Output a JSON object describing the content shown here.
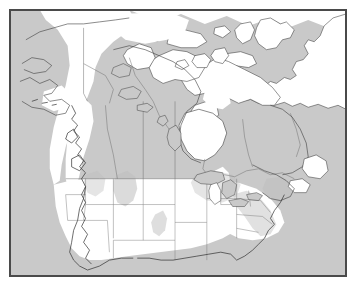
{
  "figure": {
    "kind": "distribution-range-map",
    "region": "North America",
    "frame": {
      "border_color": "#4a4a4a",
      "x": 9,
      "y": 9,
      "width": 338,
      "height": 268
    },
    "colors": {
      "background": "#ffffff",
      "ocean": "#c9c9c9",
      "land_absent": "#ffffff",
      "range_shade": "#bdbdbd",
      "coastline": "#3c3c3c",
      "political_boundary": "#6f6f6f",
      "state_boundary": "#767676"
    },
    "legend_present": false,
    "title": "",
    "caption": "",
    "axis_labels": [],
    "tick_labels": [],
    "annotations": []
  },
  "map": {
    "projection_hint": "conic",
    "countries": [
      {
        "name": "Canada",
        "shaded": true
      },
      {
        "name": "United States",
        "shaded": true
      },
      {
        "name": "Greenland",
        "shaded": false
      },
      {
        "name": "Mexico",
        "shaded": false
      }
    ],
    "water_bodies": [
      {
        "name": "Hudson Bay"
      },
      {
        "name": "Great Lakes"
      },
      {
        "name": "Great Slave Lake"
      },
      {
        "name": "Great Bear Lake"
      },
      {
        "name": "Lake Winnipeg"
      },
      {
        "name": "Pacific Ocean"
      },
      {
        "name": "Atlantic Ocean"
      },
      {
        "name": "Arctic Ocean"
      },
      {
        "name": "Gulf of Mexico"
      }
    ],
    "range_description": "Gray shading indicates species occurrence; white indicates absence."
  }
}
